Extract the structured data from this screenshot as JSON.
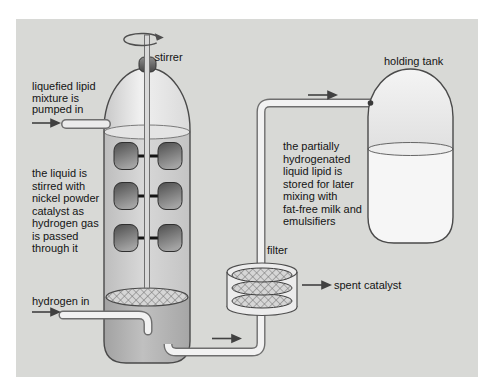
{
  "labels": {
    "stirrer": "stirrer",
    "holding_tank": "holding tank",
    "filter": "filter",
    "spent_catalyst": "spent catalyst",
    "hydrogen_in": "hydrogen in"
  },
  "annotations": {
    "inlet": {
      "lines": [
        "liquefied lipid",
        "mixture is",
        "pumped in"
      ]
    },
    "reactor": {
      "lines": [
        "the liquid is",
        "stirred with",
        "nickel powder",
        "catalyst as",
        "hydrogen gas",
        "is passed",
        "through it"
      ]
    },
    "storage": {
      "lines": [
        "the partially",
        "hydrogenated",
        "liquid lipid is",
        "stored for later",
        "mixing with",
        "fat-free milk and",
        "emulsifiers"
      ]
    }
  },
  "colors": {
    "panel_bg": "#d8d9d6",
    "outline": "#4a4a4a",
    "text": "#141414",
    "pipe_fill": "#f2f2f2",
    "pipe_edge": "#6e6e6e",
    "vessel_liquid": "#cccccc",
    "vessel_bottom": "#b0b0b0",
    "paddle_dark": "#4f4f4f",
    "arrow": "#414141"
  }
}
